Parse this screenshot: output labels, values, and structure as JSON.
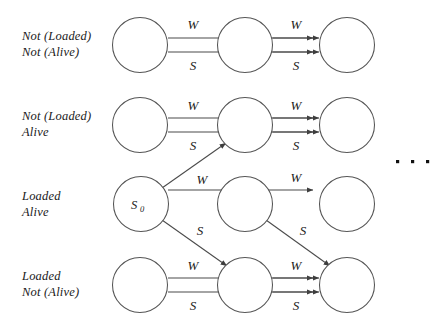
{
  "figure": {
    "type": "state-transition-diagram",
    "ellipsis": "· · ·",
    "rows": [
      {
        "id": "row-1",
        "label_lines": [
          "Not (Loaded)",
          "Not (Alive)"
        ]
      },
      {
        "id": "row-2",
        "label_lines": [
          "Not (Loaded)",
          "Alive"
        ]
      },
      {
        "id": "row-3",
        "label_lines": [
          "Loaded",
          "Alive"
        ]
      },
      {
        "id": "row-4",
        "label_lines": [
          "Loaded",
          "Not (Alive)"
        ]
      }
    ],
    "start_state": {
      "name": "S",
      "subscript": "0"
    },
    "edge_labels": {
      "wait": "W",
      "shoot": "S"
    },
    "edges": [
      {
        "from": "r1c1",
        "to": "r1c2",
        "label": "W"
      },
      {
        "from": "r1c1",
        "to": "r1c2",
        "label": "S"
      },
      {
        "from": "r1c2",
        "to": "r1c3",
        "label": "W"
      },
      {
        "from": "r1c2",
        "to": "r1c3",
        "label": "S"
      },
      {
        "from": "r2c1",
        "to": "r2c2",
        "label": "W"
      },
      {
        "from": "r2c1",
        "to": "r2c2",
        "label": "S"
      },
      {
        "from": "r2c2",
        "to": "r2c3",
        "label": "W"
      },
      {
        "from": "r2c2",
        "to": "r2c3",
        "label": "S"
      },
      {
        "from": "S0",
        "to": "r2c2",
        "label": "W"
      },
      {
        "from": "S0",
        "to": "r4c2",
        "label": "S"
      },
      {
        "from": "r3c2",
        "to": "r3c3",
        "label": "W"
      },
      {
        "from": "r3c2",
        "to": "r4c3",
        "label": "S"
      },
      {
        "from": "r4c1",
        "to": "r4c2",
        "label": "W"
      },
      {
        "from": "r4c1",
        "to": "r4c2",
        "label": "S"
      },
      {
        "from": "r4c2",
        "to": "r4c3",
        "label": "W"
      },
      {
        "from": "r4c2",
        "to": "r4c3",
        "label": "S"
      }
    ]
  },
  "colors": {
    "node_stroke": "#555555",
    "edge_stroke": "#4a4a4a",
    "text": "#1a1a1a",
    "background": "#ffffff"
  }
}
